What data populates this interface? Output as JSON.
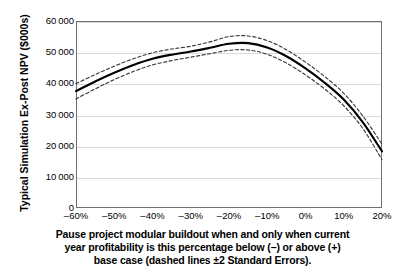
{
  "chart_data": {
    "type": "line",
    "title": "",
    "subtitle": "",
    "ylabel": "Typical Simulation Ex-Post NPV ($000s)",
    "xlabel": "Pause project modular buildout when and only when current year profitability is this percentage below (–) or above (+) base case (dashed lines ±2 Standard Errors).",
    "xlabel_lines": [
      "Pause project modular buildout when and only when current",
      "year profitability is this percentage below (–) or above (+)",
      "base case (dashed lines ±2 Standard Errors)."
    ],
    "x": [
      -60,
      -55,
      -50,
      -45,
      -40,
      -35,
      -30,
      -25,
      -20,
      -15,
      -10,
      -5,
      0,
      5,
      10,
      15,
      20
    ],
    "xtick_labels": [
      "–60%",
      "–50%",
      "–40%",
      "–30%",
      "–20%",
      "–10%",
      "0%",
      "10%",
      "20%"
    ],
    "xtick_values": [
      -60,
      -50,
      -40,
      -30,
      -20,
      -10,
      0,
      10,
      20
    ],
    "ytick_labels": [
      "0",
      "10 000",
      "20 000",
      "30 000",
      "40 000",
      "50 000",
      "60 000"
    ],
    "ytick_values": [
      0,
      10000,
      20000,
      30000,
      40000,
      50000,
      60000
    ],
    "xlim": [
      -60,
      20
    ],
    "ylim": [
      0,
      60000
    ],
    "grid": true,
    "legend": "none",
    "series": [
      {
        "name": "Mean Ex-Post NPV",
        "style": "solid",
        "color": "#000000",
        "values": [
          37500,
          40600,
          43400,
          45900,
          47900,
          49200,
          50200,
          51400,
          52700,
          52900,
          51500,
          48700,
          44800,
          40200,
          34800,
          27500,
          18200
        ]
      },
      {
        "name": "Upper +2 Standard Errors",
        "style": "dashed",
        "color": "#3a3a3a",
        "values": [
          39900,
          42800,
          45500,
          47900,
          49800,
          51000,
          51900,
          53300,
          55000,
          55200,
          53700,
          50800,
          46800,
          42200,
          36800,
          29500,
          20500
        ]
      },
      {
        "name": "Lower −2 Standard Errors",
        "style": "dashed",
        "color": "#3a3a3a",
        "values": [
          35000,
          38200,
          41200,
          43800,
          45900,
          47300,
          48400,
          49500,
          50600,
          50700,
          49300,
          46500,
          42700,
          38200,
          32800,
          25500,
          15500
        ]
      }
    ]
  },
  "colors": {
    "axis": "#6f6f6f",
    "grid": "#d9d9d9",
    "line": "#000000",
    "band": "#3a3a3a",
    "background": "#ffffff"
  }
}
